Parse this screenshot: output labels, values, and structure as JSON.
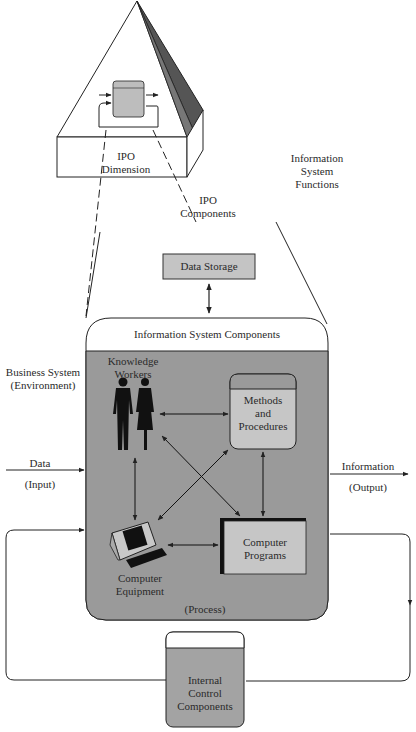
{
  "pyramid": {
    "ipo_dimension": [
      "IPO",
      "Dimension"
    ],
    "functions_label": [
      "Information",
      "System",
      "Functions"
    ],
    "ipo_components": [
      "IPO",
      "Components"
    ]
  },
  "data_storage": {
    "label": "Data Storage"
  },
  "is_components": {
    "title": "Information System Components",
    "knowledge_workers": [
      "Knowledge",
      "Workers"
    ],
    "methods": [
      "Methods",
      "and",
      "Procedures"
    ],
    "computer_equipment": [
      "Computer",
      "Equipment"
    ],
    "computer_programs": [
      "Computer",
      "Programs"
    ]
  },
  "environment": {
    "line1": "Business System",
    "line2": "(Environment)"
  },
  "input": {
    "label": "Data",
    "sub": "(Input)"
  },
  "output": {
    "label": "Information",
    "sub": "(Output)"
  },
  "process": {
    "label": "(Process)"
  },
  "internal_control": [
    "Internal",
    "Control",
    "Components"
  ],
  "colors": {
    "panel_gray": "#9a9a9a",
    "box_light": "#c9c9c9",
    "internal_control": "#a3a3a3",
    "line": "#222222"
  }
}
